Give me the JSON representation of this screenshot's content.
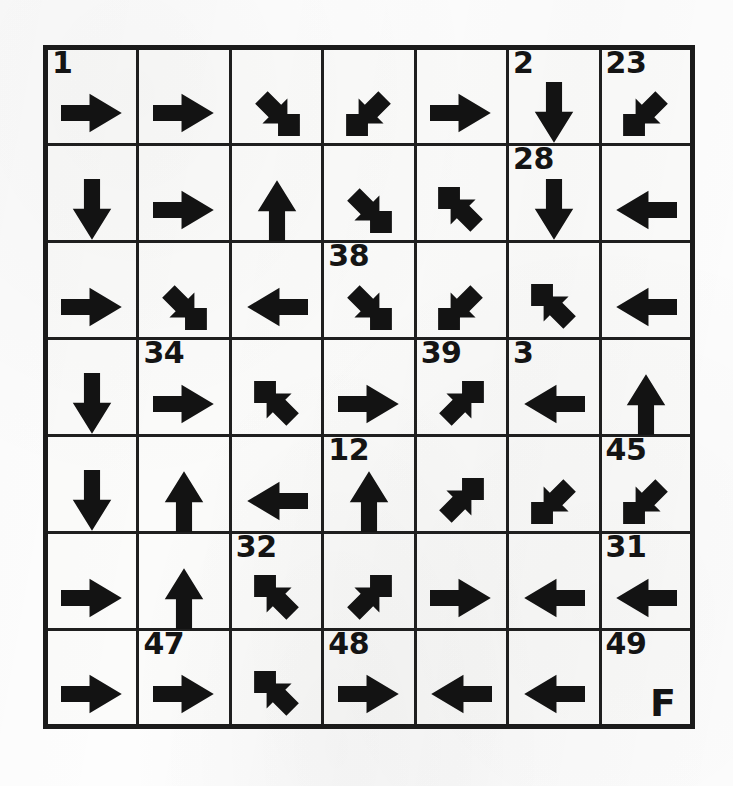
{
  "puzzle": {
    "title": "Arrow Grid Puzzle",
    "rows": 7,
    "cols": 7,
    "start_label": "1",
    "finish_label": "F",
    "ink_color": "#131313",
    "paper_color": "#fbfbfa",
    "grid": [
      [
        {
          "number": "1",
          "arrow": "right",
          "glyph": "→"
        },
        {
          "number": "",
          "arrow": "right",
          "glyph": "→"
        },
        {
          "number": "",
          "arrow": "down-right",
          "glyph": "↘"
        },
        {
          "number": "",
          "arrow": "down-left",
          "glyph": "↙"
        },
        {
          "number": "",
          "arrow": "right",
          "glyph": "→"
        },
        {
          "number": "2",
          "arrow": "down",
          "glyph": "↓"
        },
        {
          "number": "23",
          "arrow": "down-left",
          "glyph": "↙"
        }
      ],
      [
        {
          "number": "",
          "arrow": "down",
          "glyph": "↓"
        },
        {
          "number": "",
          "arrow": "right",
          "glyph": "→"
        },
        {
          "number": "",
          "arrow": "up",
          "glyph": "↑"
        },
        {
          "number": "",
          "arrow": "down-right",
          "glyph": "↘"
        },
        {
          "number": "",
          "arrow": "up-left",
          "glyph": "↖"
        },
        {
          "number": "28",
          "arrow": "down",
          "glyph": "↓"
        },
        {
          "number": "",
          "arrow": "left",
          "glyph": "←"
        }
      ],
      [
        {
          "number": "",
          "arrow": "right",
          "glyph": "→"
        },
        {
          "number": "",
          "arrow": "down-right",
          "glyph": "↘"
        },
        {
          "number": "",
          "arrow": "left",
          "glyph": "←"
        },
        {
          "number": "38",
          "arrow": "down-right",
          "glyph": "↘"
        },
        {
          "number": "",
          "arrow": "down-left",
          "glyph": "↙"
        },
        {
          "number": "",
          "arrow": "up-left",
          "glyph": "↖"
        },
        {
          "number": "",
          "arrow": "left",
          "glyph": "←"
        }
      ],
      [
        {
          "number": "",
          "arrow": "down",
          "glyph": "↓"
        },
        {
          "number": "34",
          "arrow": "right",
          "glyph": "→"
        },
        {
          "number": "",
          "arrow": "up-left",
          "glyph": "↖"
        },
        {
          "number": "",
          "arrow": "right",
          "glyph": "→"
        },
        {
          "number": "39",
          "arrow": "up-right",
          "glyph": "↗"
        },
        {
          "number": "3",
          "arrow": "left",
          "glyph": "←"
        },
        {
          "number": "",
          "arrow": "up",
          "glyph": "↑"
        }
      ],
      [
        {
          "number": "",
          "arrow": "down",
          "glyph": "↓"
        },
        {
          "number": "",
          "arrow": "up",
          "glyph": "↑"
        },
        {
          "number": "",
          "arrow": "left",
          "glyph": "←"
        },
        {
          "number": "12",
          "arrow": "up",
          "glyph": "↑"
        },
        {
          "number": "",
          "arrow": "up-right",
          "glyph": "↗"
        },
        {
          "number": "",
          "arrow": "down-left",
          "glyph": "↙"
        },
        {
          "number": "45",
          "arrow": "down-left",
          "glyph": "↙"
        }
      ],
      [
        {
          "number": "",
          "arrow": "right",
          "glyph": "→"
        },
        {
          "number": "",
          "arrow": "up",
          "glyph": "↑"
        },
        {
          "number": "32",
          "arrow": "up-left",
          "glyph": "↖"
        },
        {
          "number": "",
          "arrow": "up-right",
          "glyph": "↗"
        },
        {
          "number": "",
          "arrow": "right",
          "glyph": "→"
        },
        {
          "number": "",
          "arrow": "left",
          "glyph": "←"
        },
        {
          "number": "31",
          "arrow": "left",
          "glyph": "←"
        }
      ],
      [
        {
          "number": "",
          "arrow": "right",
          "glyph": "→"
        },
        {
          "number": "47",
          "arrow": "right",
          "glyph": "→"
        },
        {
          "number": "",
          "arrow": "up-left",
          "glyph": "↖"
        },
        {
          "number": "48",
          "arrow": "right",
          "glyph": "→"
        },
        {
          "number": "",
          "arrow": "left",
          "glyph": "←"
        },
        {
          "number": "",
          "arrow": "left",
          "glyph": "←"
        },
        {
          "number": "49",
          "arrow": "none",
          "glyph": "F"
        }
      ]
    ]
  }
}
